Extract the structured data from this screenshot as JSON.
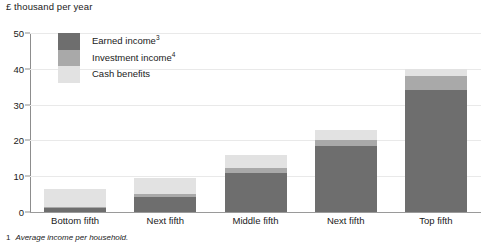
{
  "chart_data": {
    "type": "bar",
    "subtype": "stacked-vertical",
    "title": "£ thousand per year",
    "xlabel": "",
    "ylabel": "",
    "ylim": [
      0,
      50
    ],
    "yticks": [
      0,
      10,
      20,
      30,
      40,
      50
    ],
    "ytick_labels": [
      "0",
      "10",
      "20",
      "30",
      "40",
      "50"
    ],
    "grid": true,
    "grid_axis": "y",
    "legend_position": "upper-left-inside",
    "categories": [
      "Bottom fifth",
      "Next fifth",
      "Middle fifth",
      "Next fifth",
      "Top fifth"
    ],
    "series": [
      {
        "name": "Earned income",
        "footnote_marker": "3",
        "color": "#6e6e6e",
        "values": [
          1.0,
          4.3,
          11.0,
          18.4,
          34.0
        ]
      },
      {
        "name": "Investment income",
        "footnote_marker": "4",
        "color": "#a9a9a9",
        "values": [
          0.3,
          0.6,
          1.2,
          1.8,
          4.0
        ]
      },
      {
        "name": "Cash benefits",
        "footnote_marker": "",
        "color": "#e2e2e2",
        "values": [
          5.1,
          4.5,
          3.8,
          2.8,
          2.0
        ]
      }
    ],
    "totals": [
      6.4,
      9.4,
      16.0,
      23.0,
      40.0
    ],
    "annotations": []
  },
  "legend": {
    "items": [
      {
        "label": "Earned income",
        "marker": "3"
      },
      {
        "label": "Investment income",
        "marker": "4"
      },
      {
        "label": "Cash benefits",
        "marker": ""
      }
    ]
  },
  "footnote": {
    "marker": "1",
    "text": "Average income per household."
  },
  "colors": {
    "earned_income": "#6e6e6e",
    "investment_income": "#a9a9a9",
    "cash_benefits": "#e2e2e2",
    "gridline": "#e9e9e9",
    "axis": "#8d8d8d",
    "text": "#1a1a1a",
    "background": "#ffffff"
  }
}
